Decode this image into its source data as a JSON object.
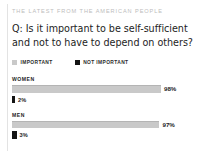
{
  "kicker": "THE LATEST FROM THE AMERICAN PEOPLE",
  "question": "Q: Is it important to be self-sufficient and not to have to depend on others?",
  "legend": {
    "important": "IMPORTANT",
    "not_important": "NOT IMPORTANT"
  },
  "colors": {
    "important": "#c9c9c9",
    "not_important": "#141414",
    "kicker": "#bdbdbd",
    "text": "#1d1d1d",
    "rule": "#e3e3e3"
  },
  "groups": [
    {
      "label": "WOMEN",
      "important_value": "98%",
      "not_important_value": "2%"
    },
    {
      "label": "MEN",
      "important_value": "97%",
      "not_important_value": "3%"
    }
  ],
  "chart_data": {
    "type": "bar",
    "title": "Q: Is it important to be self-sufficient and not to have to depend on others?",
    "subtitle": "THE LATEST FROM THE AMERICAN PEOPLE",
    "orientation": "horizontal",
    "categories": [
      "WOMEN",
      "MEN"
    ],
    "series": [
      {
        "name": "IMPORTANT",
        "color": "#c9c9c9",
        "values": [
          98,
          97
        ]
      },
      {
        "name": "NOT IMPORTANT",
        "color": "#141414",
        "values": [
          2,
          3
        ]
      }
    ],
    "unit": "%",
    "xlabel": "",
    "ylabel": "",
    "xlim": [
      0,
      100
    ],
    "grid": false,
    "legend_position": "top-left",
    "data_labels": [
      "98%",
      "2%",
      "97%",
      "3%"
    ]
  }
}
